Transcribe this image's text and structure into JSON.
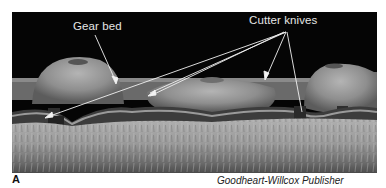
{
  "figure": {
    "panel_letter": "A",
    "credit": "Goodheart-Willcox Publisher",
    "callouts": [
      {
        "label": "Gear bed",
        "targets": 1
      },
      {
        "label": "Cutter knives",
        "targets": 4
      }
    ],
    "colors": {
      "background_sky": "#050505",
      "grass": "#9a9a9a",
      "gear": "#8c8c8c",
      "callout_line": "#f2f2f2"
    }
  }
}
